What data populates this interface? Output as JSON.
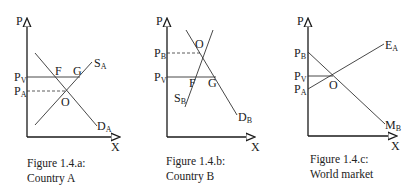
{
  "figures": [
    {
      "id": "a",
      "caption_line1": "Figure 1.4.a:",
      "caption_line2": "Country A",
      "y_axis_label": "P",
      "x_axis_label": "X",
      "price_labels": [
        {
          "main": "P",
          "sub": "V"
        },
        {
          "main": "P",
          "sub": "A"
        }
      ],
      "curves": [
        {
          "main": "S",
          "sub": "A"
        },
        {
          "main": "D",
          "sub": "A"
        }
      ],
      "points": [
        "F",
        "G",
        "O"
      ]
    },
    {
      "id": "b",
      "caption_line1": "Figure 1.4.b:",
      "caption_line2": "Country B",
      "y_axis_label": "P",
      "x_axis_label": "X",
      "price_labels": [
        {
          "main": "P",
          "sub": "B"
        },
        {
          "main": "P",
          "sub": "V"
        }
      ],
      "curves": [
        {
          "main": "S",
          "sub": "B"
        },
        {
          "main": "D",
          "sub": "B"
        }
      ],
      "points": [
        "O",
        "F",
        "G"
      ]
    },
    {
      "id": "c",
      "caption_line1": "Figure 1.4.c:",
      "caption_line2": "World market",
      "y_axis_label": "P",
      "x_axis_label": "X",
      "price_labels": [
        {
          "main": "P",
          "sub": "B"
        },
        {
          "main": "P",
          "sub": "V"
        },
        {
          "main": "P",
          "sub": "A"
        }
      ],
      "curves": [
        {
          "main": "E",
          "sub": "A"
        },
        {
          "main": "M",
          "sub": "B"
        }
      ],
      "points": [
        "O"
      ]
    }
  ]
}
